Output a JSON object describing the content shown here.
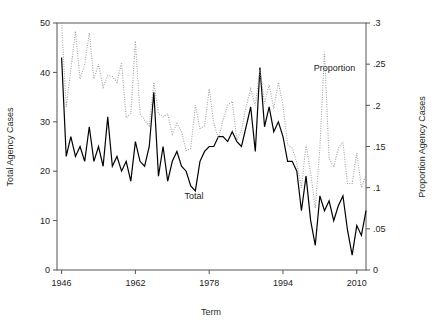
{
  "chart_data": {
    "type": "line",
    "title": "",
    "xlabel": "Term",
    "ylabel": "Total Agency Cases",
    "y2label": "Proportion Agency Cases",
    "xlim": [
      1945,
      2012
    ],
    "ylim": [
      0,
      50
    ],
    "y2lim": [
      0,
      0.3
    ],
    "grid": false,
    "legend_position": "inline-annotation",
    "x_ticks": [
      "1946",
      "1962",
      "1978",
      "1994",
      "2010"
    ],
    "x_tick_values": [
      1946,
      1962,
      1978,
      1994,
      2010
    ],
    "y_ticks": [
      "0",
      "10",
      "20",
      "30",
      "40",
      "50"
    ],
    "y_tick_values": [
      0,
      10,
      20,
      30,
      40,
      50
    ],
    "y2_ticks": [
      "0",
      ".05",
      ".1",
      ".15",
      ".2",
      ".25",
      ".3"
    ],
    "y2_tick_values": [
      0,
      0.05,
      0.1,
      0.15,
      0.2,
      0.25,
      0.3
    ],
    "x": [
      1946,
      1947,
      1948,
      1949,
      1950,
      1951,
      1952,
      1953,
      1954,
      1955,
      1956,
      1957,
      1958,
      1959,
      1960,
      1961,
      1962,
      1963,
      1964,
      1965,
      1966,
      1967,
      1968,
      1969,
      1970,
      1971,
      1972,
      1973,
      1974,
      1975,
      1976,
      1977,
      1978,
      1979,
      1980,
      1981,
      1982,
      1983,
      1984,
      1985,
      1986,
      1987,
      1988,
      1989,
      1990,
      1991,
      1992,
      1993,
      1994,
      1995,
      1996,
      1997,
      1998,
      1999,
      2000,
      2001,
      2002,
      2003,
      2004,
      2005,
      2006,
      2007,
      2008,
      2009,
      2010,
      2011,
      2012
    ],
    "series": [
      {
        "name": "Total",
        "axis": "left",
        "style": "solid",
        "color": "#000000",
        "label_text": "Total",
        "label_x": 1972,
        "label_y": 15,
        "values": [
          43,
          23,
          27,
          23,
          25,
          22,
          29,
          22,
          25,
          21,
          31,
          21,
          23,
          20,
          22,
          18,
          26,
          22,
          21,
          25,
          36,
          19,
          25,
          18,
          22,
          24,
          21,
          20,
          17,
          16,
          22,
          24,
          25,
          25,
          27,
          27,
          26,
          28,
          26,
          25,
          29,
          33,
          24,
          41,
          29,
          33,
          28,
          30,
          27,
          22,
          22,
          20,
          12,
          19,
          10,
          5,
          15,
          12,
          14,
          10,
          13,
          15,
          8,
          3,
          9,
          7,
          12
        ]
      },
      {
        "name": "Proportion",
        "axis": "right",
        "style": "dotted",
        "color": "#9a9a9a",
        "label_text": "Proportion",
        "label_x": 2000,
        "label_y": 0.245,
        "values": [
          0.3,
          0.198,
          0.243,
          0.29,
          0.232,
          0.25,
          0.288,
          0.232,
          0.25,
          0.222,
          0.236,
          0.235,
          0.228,
          0.252,
          0.185,
          0.19,
          0.278,
          0.19,
          0.182,
          0.175,
          0.228,
          0.19,
          0.186,
          0.19,
          0.165,
          0.178,
          0.168,
          0.145,
          0.148,
          0.2,
          0.172,
          0.175,
          0.22,
          0.178,
          0.16,
          0.182,
          0.2,
          0.205,
          0.158,
          0.17,
          0.198,
          0.22,
          0.2,
          0.243,
          0.202,
          0.225,
          0.196,
          0.228,
          0.2,
          0.152,
          0.148,
          0.13,
          0.1,
          0.152,
          0.118,
          0.075,
          0.148,
          0.265,
          0.135,
          0.125,
          0.148,
          0.155,
          0.105,
          0.105,
          0.142,
          0.1,
          0.115
        ]
      }
    ]
  },
  "annotations": {
    "total_label": "Total",
    "proportion_label": "Proportion"
  },
  "axes": {
    "x_title": "Term",
    "y_left_title": "Total Agency Cases",
    "y_right_title": "Proportion Agency Cases"
  }
}
